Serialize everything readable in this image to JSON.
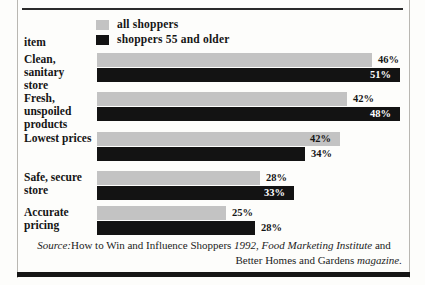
{
  "figure": {
    "axis_heading": "item"
  },
  "legend": {
    "items": [
      {
        "label": "all shoppers",
        "key": "all",
        "color": "#c3c3c3",
        "swatch_name": "legend-swatch-all-shoppers"
      },
      {
        "label": "shoppers 55 and older",
        "key": "senior",
        "color": "#131313",
        "swatch_name": "legend-swatch-seniors"
      }
    ]
  },
  "source": {
    "prefix": "Source:",
    "line1_roman_a": "How to Win and Influence Shoppers ",
    "line1_italic_a": "1992, Food Marketing Institute ",
    "line1_roman_b": "and",
    "line2_roman": "Better Homes and Gardens ",
    "line2_italic": "magazine."
  },
  "chart_data": {
    "type": "bar",
    "orientation": "horizontal",
    "title": "",
    "subtitle": "",
    "xlabel": "",
    "ylabel": "item",
    "xlim": [
      0,
      55
    ],
    "grid": false,
    "legend_position": "top",
    "value_suffix": "%",
    "categories": [
      "Clean, sanitary store",
      "Fresh, unspoiled products",
      "Lowest prices",
      "Safe, secure store",
      "Accurate pricing"
    ],
    "series": [
      {
        "name": "all shoppers",
        "key": "all",
        "color": "#c3c3c3",
        "values": [
          46,
          42,
          42,
          28,
          25
        ]
      },
      {
        "name": "shoppers 55 and older",
        "key": "senior",
        "color": "#131313",
        "values": [
          51,
          48,
          34,
          33,
          28
        ]
      }
    ],
    "groups": [
      {
        "label_line1": "Clean, sanitary",
        "label_line2": "store",
        "top": 53,
        "bars": [
          {
            "series": "all",
            "value": "46%",
            "width": 275,
            "label_placement": "outside"
          },
          {
            "series": "senior",
            "value": "51%",
            "width": 303,
            "label_placement": "inside"
          }
        ]
      },
      {
        "label_line1": "Fresh, unspoiled",
        "label_line2": "products",
        "top": 92,
        "bars": [
          {
            "series": "all",
            "value": "42%",
            "width": 250,
            "label_placement": "outside"
          },
          {
            "series": "senior",
            "value": "48%",
            "width": 303,
            "label_placement": "inside"
          }
        ]
      },
      {
        "label_line1": "Lowest prices",
        "label_line2": "",
        "top": 132,
        "bars": [
          {
            "series": "all",
            "value": "42%",
            "width": 243,
            "label_placement": "inside"
          },
          {
            "series": "senior",
            "value": "34%",
            "width": 208,
            "label_placement": "outside"
          }
        ]
      },
      {
        "label_line1": "Safe, secure",
        "label_line2": "store",
        "top": 171,
        "bars": [
          {
            "series": "all",
            "value": "28%",
            "width": 163,
            "label_placement": "outside"
          },
          {
            "series": "senior",
            "value": "33%",
            "width": 197,
            "label_placement": "inside"
          }
        ]
      },
      {
        "label_line1": "Accurate",
        "label_line2": "pricing",
        "top": 206,
        "bars": [
          {
            "series": "all",
            "value": "25%",
            "width": 129,
            "label_placement": "outside"
          },
          {
            "series": "senior",
            "value": "28%",
            "width": 158,
            "label_placement": "outside"
          }
        ]
      }
    ]
  }
}
